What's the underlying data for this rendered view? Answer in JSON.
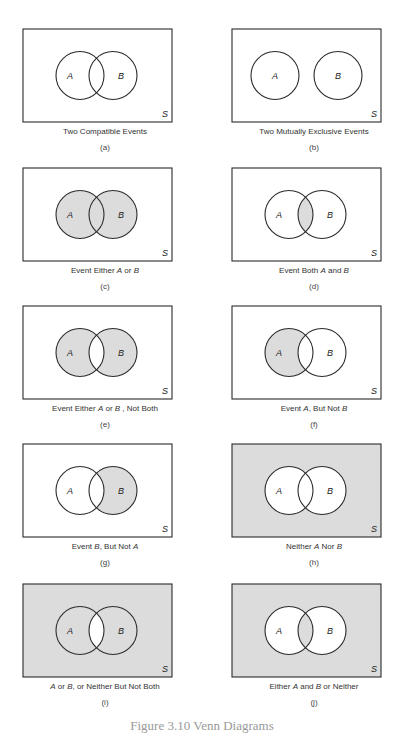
{
  "shade_color": "#dcdcdc",
  "line_color": "#2a2a2a",
  "universe_label": "S",
  "set_a_label": "A",
  "set_b_label": "B",
  "panels": [
    {
      "id": "a",
      "sub": "(a)",
      "caption": [
        "Two Compatible Events"
      ],
      "layout": "overlap",
      "shade": {
        "outside": false,
        "a_only": false,
        "b_only": false,
        "both": false
      }
    },
    {
      "id": "b",
      "sub": "(b)",
      "caption": [
        "Two Mutually Exclusive Events"
      ],
      "layout": "disjoint",
      "shade": {
        "outside": false,
        "a_only": false,
        "b_only": false,
        "both": false
      }
    },
    {
      "id": "c",
      "sub": "(c)",
      "caption": [
        "Event Either ",
        "A",
        " or ",
        "B"
      ],
      "layout": "overlap",
      "shade": {
        "outside": false,
        "a_only": true,
        "b_only": true,
        "both": true
      }
    },
    {
      "id": "d",
      "sub": "(d)",
      "caption": [
        "Event Both ",
        "A",
        " and ",
        "B"
      ],
      "layout": "overlap",
      "shade": {
        "outside": false,
        "a_only": false,
        "b_only": false,
        "both": true
      }
    },
    {
      "id": "e",
      "sub": "(e)",
      "caption": [
        "Event Either ",
        "A",
        " or ",
        "B",
        " , Not Both"
      ],
      "layout": "overlap",
      "shade": {
        "outside": false,
        "a_only": true,
        "b_only": true,
        "both": false
      }
    },
    {
      "id": "f",
      "sub": "(f)",
      "caption": [
        "Event ",
        "A",
        ", But Not ",
        "B"
      ],
      "layout": "overlap",
      "shade": {
        "outside": false,
        "a_only": true,
        "b_only": false,
        "both": false
      }
    },
    {
      "id": "g",
      "sub": "(g)",
      "caption": [
        "Event ",
        "B",
        ", But Not ",
        "A"
      ],
      "layout": "overlap",
      "shade": {
        "outside": false,
        "a_only": false,
        "b_only": true,
        "both": false
      }
    },
    {
      "id": "h",
      "sub": "(h)",
      "caption": [
        "Neither ",
        "A",
        " Nor ",
        "B"
      ],
      "layout": "overlap",
      "shade": {
        "outside": true,
        "a_only": false,
        "b_only": false,
        "both": false
      }
    },
    {
      "id": "i",
      "sub": "(i)",
      "caption": [
        "",
        "A",
        " or ",
        "B",
        ", or Neither But Not Both"
      ],
      "layout": "overlap",
      "shade": {
        "outside": true,
        "a_only": true,
        "b_only": true,
        "both": false
      }
    },
    {
      "id": "j",
      "sub": "(j)",
      "caption": [
        "Either ",
        "A",
        " and ",
        "B",
        " or Neither"
      ],
      "layout": "overlap",
      "shade": {
        "outside": true,
        "a_only": false,
        "b_only": false,
        "both": true
      }
    }
  ],
  "figure_caption": "Figure 3.10  Venn Diagrams"
}
